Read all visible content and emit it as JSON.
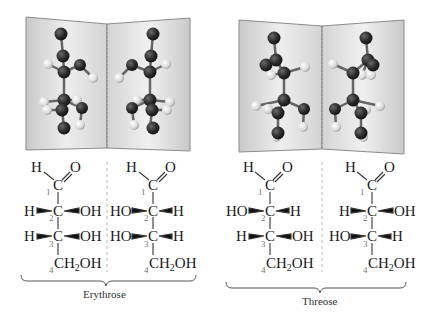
{
  "figure": {
    "panels": [
      {
        "name": "Erythrose",
        "caption": "Erythrose",
        "molecules": [
          {
            "top": {
              "left": "H",
              "right": "O"
            },
            "carbons": [
              {
                "number": "1",
                "label": "C"
              },
              {
                "number": "2",
                "label": "C",
                "left": "H",
                "right": "OH"
              },
              {
                "number": "3",
                "label": "C",
                "left": "H",
                "right": "OH"
              }
            ],
            "bottom": {
              "number": "4",
              "label_main": "CH",
              "label_sub": "2",
              "label_end": "OH"
            }
          },
          {
            "top": {
              "left": "H",
              "right": "O"
            },
            "carbons": [
              {
                "number": "1",
                "label": "C"
              },
              {
                "number": "2",
                "label": "C",
                "left": "HO",
                "right": "H"
              },
              {
                "number": "3",
                "label": "C",
                "left": "HO",
                "right": "H"
              }
            ],
            "bottom": {
              "number": "4",
              "label_main": "CH",
              "label_sub": "2",
              "label_end": "OH"
            }
          }
        ]
      },
      {
        "name": "Threose",
        "caption": "Threose",
        "molecules": [
          {
            "top": {
              "left": "H",
              "right": "O"
            },
            "carbons": [
              {
                "number": "1",
                "label": "C"
              },
              {
                "number": "2",
                "label": "C",
                "left": "HO",
                "right": "H"
              },
              {
                "number": "3",
                "label": "C",
                "left": "H",
                "right": "OH"
              }
            ],
            "bottom": {
              "number": "4",
              "label_main": "CH",
              "label_sub": "2",
              "label_end": "OH"
            }
          },
          {
            "top": {
              "left": "H",
              "right": "O"
            },
            "carbons": [
              {
                "number": "1",
                "label": "C"
              },
              {
                "number": "2",
                "label": "C",
                "left": "H",
                "right": "OH"
              },
              {
                "number": "3",
                "label": "C",
                "left": "HO",
                "right": "H"
              }
            ],
            "bottom": {
              "number": "4",
              "label_main": "CH",
              "label_sub": "2",
              "label_end": "OH"
            }
          }
        ]
      }
    ],
    "colors": {
      "atom_dark": "#2b2b2b",
      "atom_light": "#e6e6e6",
      "mirror_panel": "#dcdcdc",
      "mirror_border": "#8c8c8c",
      "text": "#1a1a1a",
      "carbon_number": "#777777"
    }
  }
}
